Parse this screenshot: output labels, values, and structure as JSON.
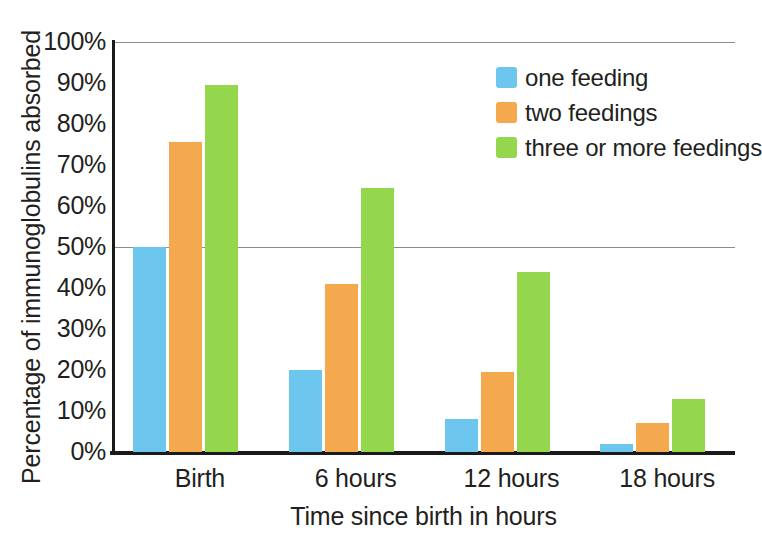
{
  "chart_data": {
    "type": "bar",
    "title": "",
    "xlabel": "Time since birth in hours",
    "ylabel": "Percentage of immunoglobulins absorbed",
    "categories": [
      "Birth",
      "6 hours",
      "12 hours",
      "18 hours"
    ],
    "series": [
      {
        "name": "one feeding",
        "color": "#6cc6ee",
        "values": [
          50,
          20,
          8,
          2
        ]
      },
      {
        "name": "two feedings",
        "color": "#f5a94e",
        "values": [
          75.5,
          41,
          19.5,
          7
        ]
      },
      {
        "name": "three or more feedings",
        "color": "#95d74c",
        "values": [
          89.5,
          64.5,
          44,
          13
        ]
      }
    ],
    "ylim": [
      0,
      100
    ],
    "ytick_labels": [
      "100%",
      "90%",
      "80%",
      "70%",
      "60%",
      "50%",
      "40%",
      "30%",
      "20%",
      "10%",
      "0%"
    ],
    "ytick_values": [
      100,
      90,
      80,
      70,
      60,
      50,
      40,
      30,
      20,
      10,
      0
    ],
    "gridlines": [
      100,
      50
    ],
    "grid": true,
    "legend_position": "top-right",
    "value_suffix": "%"
  }
}
